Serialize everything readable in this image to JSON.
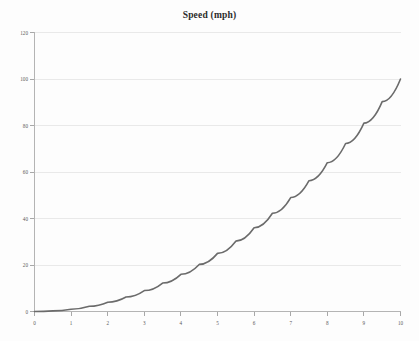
{
  "chart_data": {
    "type": "line",
    "title": "Speed (mph)",
    "subtitle": "",
    "xlabel": "",
    "ylabel": "",
    "xlim": [
      0,
      10
    ],
    "ylim": [
      0,
      120
    ],
    "grid": "horizontal",
    "legend": "none",
    "x_ticks": [
      "0",
      "1",
      "2",
      "3",
      "4",
      "5",
      "6",
      "7",
      "8",
      "9",
      "10"
    ],
    "y_ticks": [
      "0",
      "20",
      "40",
      "60",
      "80",
      "100",
      "120"
    ],
    "series": [
      {
        "name": "Speed",
        "color": "#6b6b6b",
        "x": [
          0,
          0.5,
          1,
          1.5,
          2,
          2.5,
          3,
          3.5,
          4,
          4.5,
          5,
          5.5,
          6,
          6.5,
          7,
          7.5,
          8,
          8.5,
          9,
          9.5,
          10
        ],
        "values": [
          0,
          0.25,
          1,
          2.25,
          4,
          6.25,
          9,
          12.25,
          16,
          20.25,
          25,
          30.25,
          36,
          42.25,
          49,
          56.25,
          64,
          72.25,
          81,
          90.25,
          100
        ]
      }
    ]
  },
  "colors": {
    "curve": "#6b6b6b",
    "gridline": "#e9e9e9",
    "axis": "#b4b4b4",
    "text": "#5a5a5a",
    "title": "#2b2b2b",
    "background": "#fdfdfd"
  }
}
